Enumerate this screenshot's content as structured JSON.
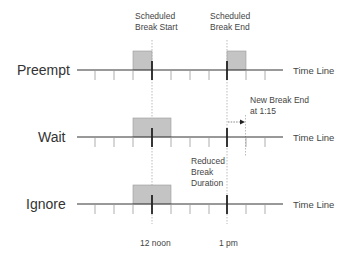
{
  "diagram": {
    "column_labels": {
      "break_start": [
        "Scheduled",
        "Break Start"
      ],
      "break_end": [
        "Scheduled",
        "Break End"
      ]
    },
    "rows": [
      {
        "label": "Preempt",
        "timeline_label": "Time Line"
      },
      {
        "label": "Wait",
        "timeline_label": "Time Line"
      },
      {
        "label": "Ignore",
        "timeline_label": "Time Line"
      }
    ],
    "annotations": {
      "new_break_end": [
        "New Break End",
        "at 1:15"
      ],
      "reduced_break": [
        "Reduced",
        "Break",
        "Duration"
      ]
    },
    "axis_labels": {
      "noon": "12 noon",
      "one_pm": "1 pm"
    },
    "colors": {
      "box_fill": "#c4c4c4",
      "box_stroke": "#9a9a9a",
      "line": "#333333",
      "tick": "#999999",
      "dotted": "#aaaaaa"
    }
  }
}
